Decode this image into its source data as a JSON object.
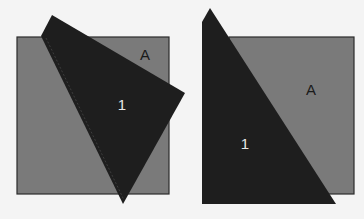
{
  "panels": [
    {
      "square_label": "A",
      "triangle_label": "1"
    },
    {
      "square_label": "A",
      "triangle_label": "1"
    }
  ],
  "colors": {
    "background": "#f4f4f4",
    "square_fill": "#7a7a7a",
    "square_stroke": "#2a2a2a",
    "triangle_fill": "#1e1e1e",
    "square_text": "#1a1a1a",
    "triangle_text": "#e6e6e6"
  }
}
